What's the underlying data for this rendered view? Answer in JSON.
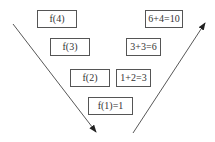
{
  "diagram": {
    "left_column": [
      {
        "label": "f(4)",
        "x": 37,
        "y": 10,
        "w": 40,
        "h": 18
      },
      {
        "label": "f(3)",
        "x": 50,
        "y": 38,
        "w": 40,
        "h": 18
      },
      {
        "label": "f(2)",
        "x": 70,
        "y": 69,
        "w": 40,
        "h": 18
      },
      {
        "label": "f(1)=1",
        "x": 88,
        "y": 97,
        "w": 45,
        "h": 18
      }
    ],
    "right_column": [
      {
        "label": "6+4=10",
        "x": 145,
        "y": 10,
        "w": 38,
        "h": 18
      },
      {
        "label": "3+3=6",
        "x": 126,
        "y": 38,
        "w": 35,
        "h": 18
      },
      {
        "label": "1+2=3",
        "x": 116,
        "y": 69,
        "w": 35,
        "h": 18
      }
    ],
    "arrows": [
      {
        "name": "descent-arrow",
        "from": [
          13,
          24
        ],
        "to": [
          96,
          132
        ]
      },
      {
        "name": "ascent-arrow",
        "from": [
          133,
          133
        ],
        "to": [
          205,
          23
        ]
      }
    ],
    "colors": {
      "line": "#444444",
      "border": "#555555",
      "text": "#333333"
    }
  }
}
